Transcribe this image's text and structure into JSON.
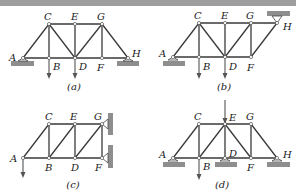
{
  "figure": {
    "panels": [
      {
        "id": "a",
        "caption": "(a)",
        "caption_pos": [
          74,
          90
        ],
        "nodes": {
          "A": [
            23,
            58
          ],
          "B": [
            49,
            58
          ],
          "C": [
            49,
            24
          ],
          "D": [
            75,
            58
          ],
          "E": [
            75,
            24
          ],
          "F": [
            102,
            58
          ],
          "G": [
            102,
            24
          ],
          "H": [
            128,
            58
          ]
        },
        "labels": {
          "A": [
            9,
            61
          ],
          "B": [
            53,
            70
          ],
          "C": [
            44,
            20
          ],
          "D": [
            79,
            70
          ],
          "E": [
            71,
            20
          ],
          "F": [
            97,
            71
          ],
          "G": [
            97,
            20
          ],
          "H": [
            132,
            57
          ]
        },
        "members": [
          [
            "A",
            "C"
          ],
          [
            "C",
            "E"
          ],
          [
            "E",
            "G"
          ],
          [
            "G",
            "H"
          ],
          [
            "A",
            "B"
          ],
          [
            "B",
            "D"
          ],
          [
            "D",
            "F"
          ],
          [
            "F",
            "H"
          ],
          [
            "C",
            "B"
          ],
          [
            "C",
            "D"
          ],
          [
            "E",
            "D"
          ],
          [
            "G",
            "D"
          ],
          [
            "G",
            "F"
          ]
        ],
        "supports": [
          {
            "type": "pin-floor",
            "at": [
              23,
              58
            ],
            "pad": [
              11,
              61,
              23,
              5
            ]
          },
          {
            "type": "pin-floor",
            "at": [
              128,
              58
            ],
            "pad": [
              117,
              61,
              22,
              5
            ]
          }
        ],
        "loads": [
          {
            "from": [
              49,
              58
            ],
            "to": [
              49,
              79
            ]
          },
          {
            "from": [
              75,
              58
            ],
            "to": [
              75,
              79
            ]
          }
        ]
      },
      {
        "id": "b",
        "caption": "(b)",
        "caption_pos": [
          224,
          90
        ],
        "nodes": {
          "A": [
            173,
            57
          ],
          "B": [
            199,
            57
          ],
          "C": [
            199,
            23
          ],
          "D": [
            225,
            57
          ],
          "E": [
            225,
            23
          ],
          "F": [
            251,
            57
          ],
          "G": [
            251,
            23
          ],
          "H": [
            277,
            23
          ]
        },
        "labels": {
          "A": [
            159,
            57
          ],
          "B": [
            203,
            70
          ],
          "C": [
            194,
            19
          ],
          "D": [
            229,
            70
          ],
          "E": [
            221,
            19
          ],
          "F": [
            247,
            71
          ],
          "G": [
            246,
            19
          ],
          "H": [
            283,
            30
          ]
        },
        "members": [
          [
            "A",
            "C"
          ],
          [
            "C",
            "E"
          ],
          [
            "E",
            "G"
          ],
          [
            "G",
            "H"
          ],
          [
            "A",
            "B"
          ],
          [
            "B",
            "D"
          ],
          [
            "D",
            "F"
          ],
          [
            "F",
            "H"
          ],
          [
            "C",
            "B"
          ],
          [
            "C",
            "D"
          ],
          [
            "E",
            "D"
          ],
          [
            "G",
            "D"
          ],
          [
            "G",
            "F"
          ]
        ],
        "supports": [
          {
            "type": "pin-floor",
            "at": [
              173,
              57
            ],
            "pad": [
              163,
              61,
              22,
              5
            ]
          },
          {
            "type": "pin-ceiling",
            "at": [
              277,
              23
            ],
            "pad": [
              267,
              11,
              23,
              5
            ]
          }
        ],
        "loads": [
          {
            "from": [
              199,
              57
            ],
            "to": [
              199,
              79
            ]
          },
          {
            "from": [
              225,
              57
            ],
            "to": [
              225,
              79
            ]
          }
        ]
      },
      {
        "id": "c",
        "caption": "(c)",
        "caption_pos": [
          73,
          188
        ],
        "nodes": {
          "A": [
            23,
            158
          ],
          "B": [
            49,
            158
          ],
          "C": [
            49,
            124
          ],
          "D": [
            75,
            158
          ],
          "E": [
            75,
            124
          ],
          "F": [
            102,
            158
          ],
          "G": [
            102,
            124
          ]
        },
        "labels": {
          "A": [
            10,
            162
          ],
          "B": [
            45,
            171
          ],
          "C": [
            45,
            120
          ],
          "D": [
            71,
            171
          ],
          "E": [
            70,
            120
          ],
          "F": [
            95,
            171
          ],
          "G": [
            94,
            120
          ]
        },
        "members": [
          [
            "A",
            "C"
          ],
          [
            "C",
            "E"
          ],
          [
            "E",
            "G"
          ],
          [
            "A",
            "B"
          ],
          [
            "B",
            "D"
          ],
          [
            "D",
            "F"
          ],
          [
            "C",
            "B"
          ],
          [
            "B",
            "E"
          ],
          [
            "E",
            "D"
          ],
          [
            "D",
            "G"
          ],
          [
            "G",
            "F"
          ]
        ],
        "supports": [
          {
            "type": "pin-wall",
            "at": [
              102,
              124
            ],
            "pad": [
              108,
              113,
              5,
              22
            ]
          },
          {
            "type": "pin-wall",
            "at": [
              102,
              158
            ],
            "pad": [
              108,
              145,
              5,
              23
            ]
          }
        ],
        "loads": [
          {
            "from": [
              23,
              158
            ],
            "to": [
              23,
              178
            ]
          }
        ]
      },
      {
        "id": "d",
        "caption": "(d)",
        "caption_pos": [
          222,
          188
        ],
        "nodes": {
          "A": [
            173,
            158
          ],
          "B": [
            199,
            158
          ],
          "C": [
            199,
            124
          ],
          "D": [
            225,
            158
          ],
          "E": [
            225,
            124
          ],
          "F": [
            251,
            158
          ],
          "G": [
            251,
            124
          ],
          "H": [
            277,
            158
          ]
        },
        "labels": {
          "A": [
            159,
            158
          ],
          "B": [
            203,
            170
          ],
          "C": [
            194,
            120
          ],
          "D": [
            229,
            157
          ],
          "E": [
            229,
            121
          ],
          "F": [
            247,
            171
          ],
          "G": [
            246,
            120
          ],
          "H": [
            283,
            158
          ]
        },
        "members": [
          [
            "A",
            "C"
          ],
          [
            "C",
            "E"
          ],
          [
            "E",
            "G"
          ],
          [
            "G",
            "H"
          ],
          [
            "A",
            "B"
          ],
          [
            "B",
            "D"
          ],
          [
            "D",
            "F"
          ],
          [
            "F",
            "H"
          ],
          [
            "C",
            "B"
          ],
          [
            "B",
            "E"
          ],
          [
            "E",
            "D"
          ],
          [
            "E",
            "F"
          ],
          [
            "G",
            "F"
          ]
        ],
        "supports": [
          {
            "type": "pin-floor",
            "at": [
              173,
              158
            ],
            "pad": [
              163,
              162,
              22,
              5
            ]
          },
          {
            "type": "pin-floor",
            "at": [
              225,
              158
            ],
            "pad": [
              215,
              162,
              22,
              5
            ]
          },
          {
            "type": "pin-floor",
            "at": [
              277,
              158
            ],
            "pad": [
              267,
              162,
              23,
              5
            ]
          }
        ],
        "loads": [
          {
            "from": [
              199,
              158
            ],
            "to": [
              199,
              180
            ]
          },
          {
            "from": [
              225,
              100
            ],
            "to": [
              225,
              124
            ]
          }
        ]
      }
    ]
  }
}
